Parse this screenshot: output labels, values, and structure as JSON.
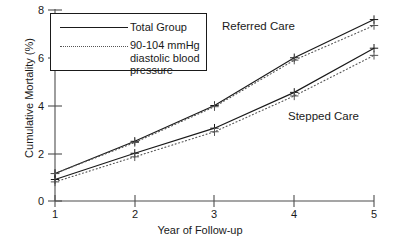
{
  "chart_data": {
    "type": "line",
    "title": "",
    "xlabel": "Year of Follow-up",
    "ylabel": "Cumulative Mortality (%)",
    "x": [
      1,
      2,
      3,
      4,
      5
    ],
    "xticklabels": [
      "1",
      "2",
      "3",
      "4",
      "5"
    ],
    "yticklabels": [
      "0",
      "2",
      "4",
      "6",
      "8"
    ],
    "yticks": [
      0,
      2,
      4,
      6,
      8
    ],
    "xlim": [
      1,
      5
    ],
    "ylim": [
      0,
      8
    ],
    "grid": false,
    "legend_position": "upper-left",
    "marker": "plus",
    "series": [
      {
        "name": "Referred Care — Total Group",
        "group": "Referred Care",
        "line": "Total Group",
        "style": "solid",
        "values": [
          1.15,
          2.5,
          4.0,
          6.0,
          7.6
        ]
      },
      {
        "name": "Referred Care — 90-104 mmHg diastolic blood pressure",
        "group": "Referred Care",
        "line": "90-104 mmHg diastolic blood pressure",
        "style": "dotted",
        "values": [
          1.15,
          2.45,
          3.95,
          5.9,
          7.35
        ]
      },
      {
        "name": "Stepped Care — Total Group",
        "group": "Stepped Care",
        "line": "Total Group",
        "style": "solid",
        "values": [
          0.9,
          2.0,
          3.05,
          4.55,
          6.4
        ]
      },
      {
        "name": "Stepped Care — 90-104 mmHg diastolic blood pressure",
        "group": "Stepped Care",
        "line": "90-104 mmHg diastolic blood pressure",
        "style": "dotted",
        "values": [
          0.8,
          1.85,
          2.9,
          4.4,
          6.1
        ]
      }
    ],
    "annotations": [
      {
        "text": "Referred Care",
        "x": 3.2,
        "y": 7.0
      },
      {
        "text": "Stepped Care",
        "x": 4.4,
        "y": 3.2
      }
    ],
    "legend": [
      {
        "label": "Total Group",
        "style": "solid"
      },
      {
        "label": "90-104 mmHg\ndiastolic blood\npressure",
        "style": "dotted"
      }
    ],
    "colors": {
      "solid_line": "#1a1a1a",
      "dotted_line": "#555555",
      "axis": "#4d4d4d",
      "text": "#1a1a1a",
      "background": "#ffffff"
    }
  },
  "axis": {
    "ytick_0": "0",
    "ytick_2": "2",
    "ytick_4": "4",
    "ytick_6": "6",
    "ytick_8": "8",
    "xtick_1": "1",
    "xtick_2": "2",
    "xtick_3": "3",
    "xtick_4": "4",
    "xtick_5": "5",
    "xlabel": "Year of Follow-up",
    "ylabel": "Cumulative Mortality (%)"
  },
  "legend": {
    "total_group": "Total Group",
    "dbp": "90-104 mmHg\ndiastolic blood\npressure"
  },
  "annotations": {
    "referred": "Referred Care",
    "stepped": "Stepped Care"
  }
}
